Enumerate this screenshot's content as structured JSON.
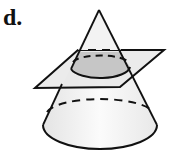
{
  "figure": {
    "label": "d.",
    "colors": {
      "stroke": "#111111",
      "cone_fill": "#f1f1f1",
      "plane_fill": "#e6e6e6",
      "section_fill": "#c4c4c4"
    }
  }
}
